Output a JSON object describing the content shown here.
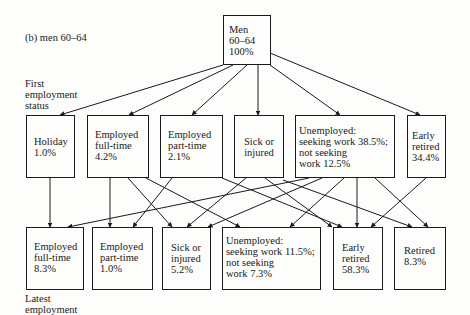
{
  "figure": {
    "caption": "(b) men 60–64",
    "row_labels": {
      "first": [
        "First",
        "employment",
        "status"
      ],
      "latest": [
        "Latest",
        "employment"
      ]
    },
    "root": {
      "lines": [
        "Men",
        "60–64",
        "100%"
      ]
    },
    "first_status": [
      {
        "id": "holiday",
        "lines": [
          "Holiday",
          "1.0%"
        ]
      },
      {
        "id": "employed-full-time",
        "lines": [
          "Employed",
          "full-time",
          "4.2%"
        ]
      },
      {
        "id": "employed-part-time",
        "lines": [
          "Employed",
          "part-time",
          "2.1%"
        ]
      },
      {
        "id": "sick-or-injured",
        "lines": [
          "Sick or",
          "injured"
        ]
      },
      {
        "id": "unemployed",
        "lines": [
          "Unemployed:",
          "seeking work 38.5%;",
          "not seeking",
          "work 12.5%"
        ]
      },
      {
        "id": "early-retired",
        "lines": [
          "Early",
          "retired",
          "34.4%"
        ]
      }
    ],
    "latest_status": [
      {
        "id": "employed-full-time",
        "lines": [
          "Employed",
          "full-time",
          "8.3%"
        ]
      },
      {
        "id": "employed-part-time",
        "lines": [
          "Employed",
          "part-time",
          "1.0%"
        ]
      },
      {
        "id": "sick-or-injured",
        "lines": [
          "Sick or",
          "injured",
          "5.2%"
        ]
      },
      {
        "id": "unemployed",
        "lines": [
          "Unemployed:",
          "seeking work 11.5%;",
          "not seeking",
          "work 7.3%"
        ]
      },
      {
        "id": "early-retired",
        "lines": [
          "Early",
          "retired",
          "58.3%"
        ]
      },
      {
        "id": "retired",
        "lines": [
          "Retired",
          "8.3%"
        ]
      }
    ],
    "transitions": [
      [
        "holiday",
        "employed-full-time"
      ],
      [
        "employed-full-time",
        "employed-part-time"
      ],
      [
        "employed-full-time",
        "sick-or-injured"
      ],
      [
        "employed-full-time",
        "unemployed"
      ],
      [
        "employed-part-time",
        "employed-part-time"
      ],
      [
        "employed-part-time",
        "early-retired"
      ],
      [
        "sick-or-injured",
        "sick-or-injured"
      ],
      [
        "sick-or-injured",
        "early-retired"
      ],
      [
        "sick-or-injured",
        "retired"
      ],
      [
        "unemployed",
        "employed-full-time"
      ],
      [
        "unemployed",
        "sick-or-injured"
      ],
      [
        "unemployed",
        "unemployed"
      ],
      [
        "unemployed",
        "early-retired"
      ],
      [
        "unemployed",
        "retired"
      ],
      [
        "early-retired",
        "early-retired"
      ]
    ]
  }
}
